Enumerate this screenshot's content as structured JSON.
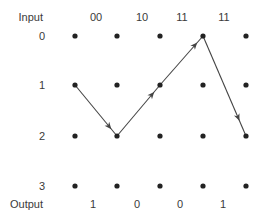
{
  "header": {
    "input_label": "Input",
    "output_label": "Output"
  },
  "input_symbols": [
    "00",
    "10",
    "11",
    "11"
  ],
  "states": [
    "0",
    "1",
    "2",
    "3"
  ],
  "output_bits": [
    "1",
    "0",
    "0",
    "1"
  ],
  "columns": 5,
  "path": [
    {
      "col": 0,
      "state": 1
    },
    {
      "col": 1,
      "state": 2
    },
    {
      "col": 2,
      "state": 1
    },
    {
      "col": 3,
      "state": 0
    },
    {
      "col": 4,
      "state": 2
    }
  ],
  "colors": {
    "dot": "#222222",
    "edge": "#444444",
    "text": "#3a3a3a"
  }
}
